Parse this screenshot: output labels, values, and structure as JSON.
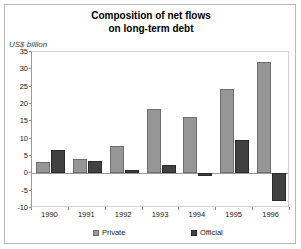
{
  "chart_data": {
    "type": "bar",
    "title": "Composition of net flows on long-term debt",
    "title_line1": "Composition of net flows",
    "title_line2": "on long-term debt",
    "ylabel": "US$ billion",
    "xlabel": "",
    "categories": [
      "1990",
      "1991",
      "1992",
      "1993",
      "1994",
      "1995",
      "1996"
    ],
    "series": [
      {
        "name": "Private",
        "color": "#969696",
        "values": [
          3.3,
          4.2,
          7.8,
          18.6,
          16.3,
          24.4,
          32.2
        ]
      },
      {
        "name": "Official",
        "color": "#414141",
        "values": [
          6.6,
          3.5,
          1.1,
          2.4,
          -0.7,
          9.5,
          -8.0
        ]
      }
    ],
    "ylim": [
      -10,
      35
    ],
    "yticks": [
      35,
      30,
      25,
      20,
      15,
      10,
      5,
      0,
      -5,
      -10
    ],
    "ytick_labels": [
      "35",
      "30",
      "25",
      "20",
      "15",
      "10",
      "5",
      "0",
      "-5",
      "-10"
    ],
    "grid": false,
    "legend_position": "bottom",
    "legend": [
      "Private",
      "Official"
    ]
  }
}
